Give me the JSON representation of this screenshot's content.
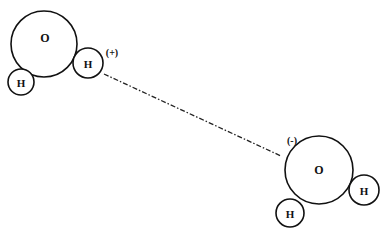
{
  "diagram": {
    "molecule_1": {
      "oxygen": {
        "label": "O"
      },
      "hydrogen_1": {
        "label": "H"
      },
      "hydrogen_2": {
        "label": "H"
      },
      "partial_charge": "(+)"
    },
    "molecule_2": {
      "oxygen": {
        "label": "O"
      },
      "hydrogen_1": {
        "label": "H"
      },
      "hydrogen_2": {
        "label": "H"
      },
      "partial_charge": "(-)"
    },
    "bond": {
      "style": "dash-dot",
      "type": "hydrogen-bond"
    },
    "colors": {
      "stroke": "#111111",
      "background": "#ffffff"
    }
  }
}
